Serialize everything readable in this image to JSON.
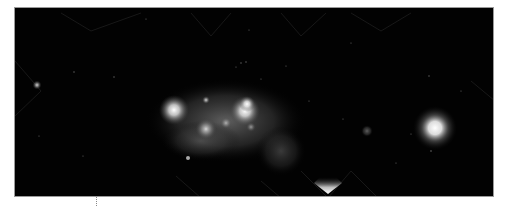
{
  "image": {
    "description": "Astronomical image of an irregular galaxy with bright star-forming knots, a compact bright source on the right, a faint star on the left, and a bright triangular artifact at the bottom edge",
    "background_color": "#020202",
    "border_color": "#9a9a9a",
    "features": [
      {
        "name": "galaxy-diffuse-glow",
        "cx": 230,
        "cy": 118,
        "rx": 80,
        "ry": 40,
        "color": "#5a5a5a"
      },
      {
        "name": "knot-left",
        "cx": 173,
        "cy": 109,
        "r": 12,
        "color": "#eeeeee"
      },
      {
        "name": "knot-right",
        "cx": 244,
        "cy": 110,
        "r": 12,
        "color": "#f4f4f4"
      },
      {
        "name": "knot-center",
        "cx": 205,
        "cy": 128,
        "r": 9,
        "color": "#cfcfcf"
      },
      {
        "name": "knot-small-top",
        "cx": 205,
        "cy": 99,
        "r": 4,
        "color": "#bbbbbb"
      },
      {
        "name": "bright-source-right",
        "cx": 434,
        "cy": 127,
        "r": 16,
        "color": "#ffffff"
      },
      {
        "name": "star-left",
        "cx": 36,
        "cy": 84,
        "r": 4,
        "color": "#cccccc"
      },
      {
        "name": "faint-patch",
        "cx": 366,
        "cy": 130,
        "r": 5,
        "color": "#444444"
      },
      {
        "name": "bottom-artifact",
        "cx": 327,
        "cy": 188,
        "color": "#ffffff"
      }
    ]
  }
}
